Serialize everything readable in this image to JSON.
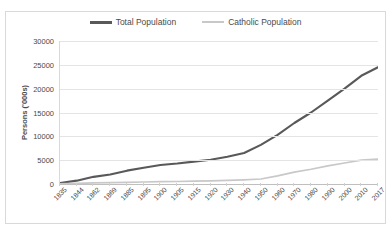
{
  "chart_data": {
    "type": "line",
    "title": "",
    "xlabel": "",
    "ylabel": "Persons ('000s)",
    "ylim": [
      0,
      30000
    ],
    "yticks": [
      30000,
      25000,
      20000,
      15000,
      10000,
      5000,
      0
    ],
    "ytick_labels": [
      "30000",
      "25000",
      "20000",
      "15000",
      "10000",
      "5000",
      "0"
    ],
    "grid": "horizontal",
    "legend_position": "top-center",
    "categories": [
      "1835",
      "1844",
      "1862",
      "1869",
      "1885",
      "1895",
      "1900",
      "1905",
      "1915",
      "1920",
      "1930",
      "1940",
      "1950",
      "1960",
      "1970",
      "1980",
      "1990",
      "2000",
      "2010",
      "2017"
    ],
    "series": [
      {
        "name": "Total Population",
        "color": "#595959",
        "values": [
          200,
          700,
          1500,
          2000,
          2800,
          3400,
          4000,
          4300,
          4700,
          5100,
          5700,
          6500,
          8200,
          10300,
          12800,
          15000,
          17500,
          20000,
          22700,
          24500
        ]
      },
      {
        "name": "Catholic Population",
        "color": "#c8c8c8",
        "values": [
          50,
          120,
          220,
          280,
          360,
          420,
          480,
          520,
          600,
          660,
          760,
          870,
          1050,
          1700,
          2500,
          3100,
          3800,
          4400,
          5000,
          5200
        ]
      }
    ]
  },
  "legend": {
    "entries": [
      {
        "label": "Total Population"
      },
      {
        "label": "Catholic Population"
      }
    ]
  },
  "colors": {
    "total_population": "#595959",
    "catholic_population": "#c8c8c8",
    "gridline": "#e4e4e4",
    "axis": "#bfbfbf",
    "text": "#4a4a4a",
    "border": "#d9d9d9"
  }
}
